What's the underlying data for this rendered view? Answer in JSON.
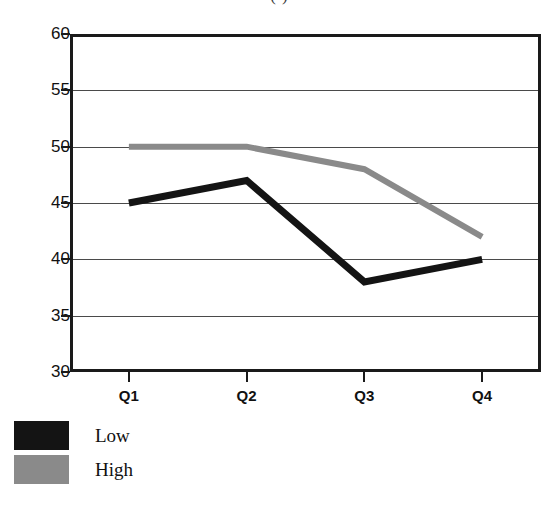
{
  "title_fragment": "(          )",
  "chart_data": {
    "type": "line",
    "title": "",
    "xlabel": "",
    "ylabel": "",
    "categories": [
      "Q1",
      "Q2",
      "Q3",
      "Q4"
    ],
    "ylim": [
      30,
      60
    ],
    "yticks": [
      30,
      35,
      40,
      45,
      50,
      55,
      60
    ],
    "ytick_labels": [
      "30",
      "35",
      "40",
      "45",
      "50",
      "55",
      "60"
    ],
    "grid": true,
    "grid_axis": "y",
    "legend_position": "below-left",
    "series": [
      {
        "name": "Low",
        "color": "#141414",
        "values": [
          45,
          47,
          38,
          40
        ]
      },
      {
        "name": "High",
        "color": "#8a8a8a",
        "values": [
          50,
          50,
          48,
          42
        ]
      }
    ]
  },
  "legend": {
    "items": [
      {
        "label": "Low",
        "color": "#141414"
      },
      {
        "label": "High",
        "color": "#8a8a8a"
      }
    ]
  }
}
